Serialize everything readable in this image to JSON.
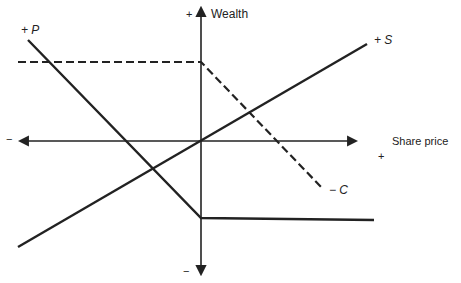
{
  "diagram": {
    "type": "payoff-diagram",
    "axes": {
      "y_label": "Wealth",
      "x_label": "Share price",
      "y_plus": "+",
      "y_minus": "−",
      "x_plus": "+",
      "x_minus": "−"
    },
    "series": [
      {
        "id": "P",
        "label": "+ P",
        "style": "solid",
        "description": "Long put: declines with share price until strike, then flat (negative)"
      },
      {
        "id": "S",
        "label": "+ S",
        "style": "solid",
        "description": "Long stock: straight line through origin"
      },
      {
        "id": "C",
        "label": "− C",
        "style": "dashed",
        "description": "Short call: flat positive until strike, then declines"
      }
    ],
    "colors": {
      "line": "#222222",
      "background": "#ffffff"
    }
  }
}
